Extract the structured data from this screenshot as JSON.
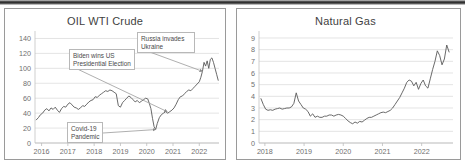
{
  "figure": {
    "background": "#ffffff",
    "panel_border": "#9a9a9a",
    "line_color": "#595959",
    "grid_color": "#d9d9d9",
    "text_color": "#5a5a5a"
  },
  "charts": [
    {
      "id": "oil",
      "title": "OIL WTI  Crude",
      "annotations": [
        {
          "id": "biden",
          "line1": "Biden wins US",
          "line2": "Presidential Election"
        },
        {
          "id": "russia",
          "line1": "Russia invades",
          "line2": "Ukraine"
        },
        {
          "id": "covid",
          "line1": "Covid-19",
          "line2": "Pandemic"
        }
      ]
    },
    {
      "id": "gas",
      "title": "Natural Gas",
      "annotations": []
    }
  ],
  "chart_data": [
    {
      "type": "line",
      "id": "oil",
      "title": "OIL WTI  Crude",
      "xlabel": "",
      "ylabel": "",
      "grid": true,
      "legend": null,
      "ylim": [
        0,
        150
      ],
      "yticks": [
        0,
        20,
        40,
        60,
        80,
        100,
        120,
        140
      ],
      "xlim": [
        2015.75,
        2022.75
      ],
      "xticks": [
        2016,
        2017,
        2018,
        2019,
        2020,
        2021,
        2022
      ],
      "xticklabels": [
        "2016",
        "2017",
        "2018",
        "2019",
        "2020",
        "2021",
        "2022"
      ],
      "series": [
        {
          "name": "WTI Crude spot price (USD/bbl)",
          "x": [
            2015.8,
            2015.88,
            2015.96,
            2016.04,
            2016.12,
            2016.2,
            2016.28,
            2016.36,
            2016.44,
            2016.52,
            2016.6,
            2016.68,
            2016.76,
            2016.84,
            2016.92,
            2017.0,
            2017.08,
            2017.16,
            2017.24,
            2017.32,
            2017.4,
            2017.48,
            2017.56,
            2017.64,
            2017.72,
            2017.8,
            2017.88,
            2017.96,
            2018.04,
            2018.12,
            2018.2,
            2018.28,
            2018.36,
            2018.44,
            2018.52,
            2018.6,
            2018.68,
            2018.76,
            2018.84,
            2018.92,
            2019.0,
            2019.08,
            2019.16,
            2019.24,
            2019.32,
            2019.4,
            2019.48,
            2019.56,
            2019.64,
            2019.72,
            2019.8,
            2019.88,
            2019.96,
            2020.04,
            2020.1,
            2020.16,
            2020.22,
            2020.28,
            2020.34,
            2020.4,
            2020.48,
            2020.56,
            2020.64,
            2020.72,
            2020.8,
            2020.88,
            2020.96,
            2021.04,
            2021.12,
            2021.2,
            2021.28,
            2021.36,
            2021.44,
            2021.52,
            2021.6,
            2021.68,
            2021.76,
            2021.84,
            2021.92,
            2022.0,
            2022.06,
            2022.12,
            2022.18,
            2022.24,
            2022.3,
            2022.36,
            2022.42,
            2022.48,
            2022.54,
            2022.6,
            2022.66,
            2022.72
          ],
          "y": [
            31,
            34,
            38,
            40,
            44,
            46,
            43,
            47,
            45,
            48,
            44,
            41,
            46,
            49,
            48,
            52,
            54,
            51,
            48,
            47,
            45,
            47,
            50,
            49,
            52,
            55,
            57,
            58,
            62,
            61,
            64,
            66,
            68,
            70,
            69,
            71,
            70,
            68,
            66,
            50,
            48,
            54,
            57,
            60,
            63,
            61,
            58,
            55,
            57,
            54,
            56,
            58,
            60,
            59,
            53,
            46,
            33,
            22,
            18,
            26,
            34,
            38,
            40,
            42,
            40,
            42,
            44,
            47,
            52,
            58,
            62,
            63,
            66,
            69,
            71,
            70,
            73,
            76,
            79,
            82,
            88,
            96,
            108,
            103,
            110,
            100,
            112,
            114,
            108,
            100,
            92,
            84
          ],
          "color": "#595959"
        }
      ],
      "annotations": [
        {
          "text": "Biden wins US\nPresidential Election",
          "point_x": 2020.78,
          "point_y": 42
        },
        {
          "text": "Russia invades\nUkraine",
          "point_x": 2022.12,
          "point_y": 96
        },
        {
          "text": "Covid-19\nPandemic",
          "point_x": 2020.34,
          "point_y": 18
        }
      ]
    },
    {
      "type": "line",
      "id": "gas",
      "title": "Natural Gas",
      "xlabel": "",
      "ylabel": "",
      "grid": true,
      "legend": null,
      "ylim": [
        0,
        9.6
      ],
      "yticks": [
        0,
        1,
        2,
        3,
        4,
        5,
        6,
        7,
        8,
        9
      ],
      "xlim": [
        2017.85,
        2022.8
      ],
      "xticks": [
        2018,
        2019,
        2020,
        2021,
        2022
      ],
      "xticklabels": [
        "2018",
        "2019",
        "2020",
        "2021",
        "2022"
      ],
      "series": [
        {
          "name": "Henry Hub natural gas price (USD/MMBtu)",
          "x": [
            2017.9,
            2017.96,
            2018.02,
            2018.08,
            2018.14,
            2018.2,
            2018.26,
            2018.32,
            2018.38,
            2018.44,
            2018.5,
            2018.56,
            2018.62,
            2018.68,
            2018.74,
            2018.8,
            2018.86,
            2018.92,
            2018.98,
            2019.04,
            2019.1,
            2019.16,
            2019.22,
            2019.28,
            2019.34,
            2019.4,
            2019.46,
            2019.52,
            2019.58,
            2019.64,
            2019.7,
            2019.76,
            2019.82,
            2019.88,
            2019.94,
            2020.0,
            2020.06,
            2020.12,
            2020.18,
            2020.24,
            2020.3,
            2020.36,
            2020.42,
            2020.48,
            2020.54,
            2020.6,
            2020.66,
            2020.72,
            2020.78,
            2020.84,
            2020.9,
            2020.96,
            2021.02,
            2021.08,
            2021.14,
            2021.2,
            2021.26,
            2021.32,
            2021.38,
            2021.44,
            2021.5,
            2021.56,
            2021.62,
            2021.68,
            2021.74,
            2021.8,
            2021.86,
            2021.92,
            2021.98,
            2022.04,
            2022.1,
            2022.16,
            2022.22,
            2022.28,
            2022.34,
            2022.4,
            2022.46,
            2022.52,
            2022.58,
            2022.64,
            2022.7
          ],
          "y": [
            3.8,
            3.3,
            2.9,
            2.8,
            2.85,
            2.8,
            2.9,
            2.95,
            3.0,
            2.9,
            2.95,
            3.0,
            3.0,
            3.1,
            3.4,
            4.3,
            3.6,
            3.3,
            3.0,
            2.9,
            2.7,
            2.3,
            2.5,
            2.2,
            2.3,
            2.2,
            2.2,
            2.3,
            2.3,
            2.4,
            2.4,
            2.3,
            2.4,
            2.45,
            2.4,
            2.3,
            2.1,
            1.9,
            1.75,
            1.65,
            1.8,
            1.7,
            1.85,
            1.8,
            1.95,
            2.1,
            2.2,
            2.2,
            2.3,
            2.4,
            2.5,
            2.6,
            2.65,
            2.6,
            2.7,
            2.8,
            3.0,
            3.3,
            3.6,
            3.9,
            4.3,
            4.7,
            5.2,
            5.4,
            5.3,
            4.9,
            5.2,
            4.6,
            5.1,
            5.4,
            4.9,
            4.7,
            5.5,
            6.3,
            7.0,
            7.9,
            7.5,
            6.7,
            7.2,
            8.4,
            7.8
          ],
          "color": "#595959"
        }
      ],
      "annotations": []
    }
  ]
}
